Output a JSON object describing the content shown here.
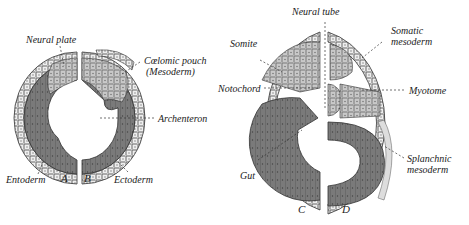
{
  "diagram": {
    "panels": [
      {
        "id": "A",
        "label": "A"
      },
      {
        "id": "B",
        "label": "B"
      },
      {
        "id": "C",
        "label": "C"
      },
      {
        "id": "D",
        "label": "D"
      }
    ],
    "labels_left": {
      "neural_plate": "Neural plate",
      "coelomic_pouch": "Cœlomic pouch",
      "mesoderm_paren": "(Mesoderm)",
      "archenteron": "Archenteron",
      "entoderm": "Entoderm",
      "ectoderm": "Ectoderm"
    },
    "labels_right": {
      "neural_tube": "Neural tube",
      "somite": "Somite",
      "somatic": "Somatic",
      "somatic_mesoderm": "mesoderm",
      "notochord": "Notochord",
      "myotome": "Myotome",
      "gut": "Gut",
      "splanchnic": "Splanchnic",
      "splanchnic_mesoderm": "mesoderm"
    },
    "colors": {
      "ectoderm": "#e8e8e8",
      "mesoderm": "#cfcfcf",
      "entoderm": "#7a7a7a",
      "outline": "#333333"
    }
  }
}
